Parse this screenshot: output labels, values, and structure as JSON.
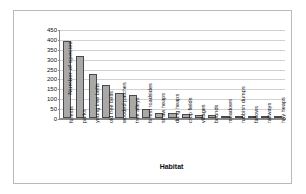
{
  "chart_data": {
    "type": "bar",
    "title": "",
    "xlabel": "Habitat",
    "ylabel": "Number of species",
    "ylim": [
      0,
      450
    ],
    "ytick_step": 50,
    "yticks": [
      0,
      50,
      100,
      150,
      200,
      250,
      300,
      350,
      400,
      450
    ],
    "grid": true,
    "legend": false,
    "bar_color": "#a9a9a9",
    "bar_border_color": "#4a4a4a",
    "categories": [
      "forests",
      "parks",
      "young tree belts",
      "old tree belts",
      "wooded patches",
      "tree alleys",
      "forest roadsides",
      "straw heaps",
      "dung heaps",
      "crop fields",
      "villages",
      "bounds",
      "meadows",
      "rubbish dumps",
      "fallows",
      "railways",
      "hay heaps"
    ],
    "values": [
      390,
      312,
      225,
      168,
      124,
      118,
      47,
      27,
      26,
      18,
      15,
      16,
      9,
      5,
      5,
      2,
      1
    ]
  }
}
